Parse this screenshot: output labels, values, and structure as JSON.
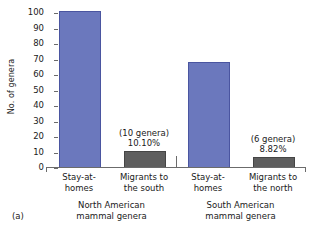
{
  "panel": {
    "label": "(a)"
  },
  "chart_data": {
    "type": "bar",
    "title": "",
    "xlabel": "",
    "ylabel": "No. of genera",
    "ylim": [
      0,
      100
    ],
    "yticks": [
      0,
      10,
      20,
      30,
      40,
      50,
      60,
      70,
      80,
      90,
      100
    ],
    "grid": false,
    "legend": "none",
    "categories": [
      "Stay-at-homes",
      "Migrants to the south",
      "Stay-at-homes",
      "Migrants to the north"
    ],
    "values": [
      100,
      10,
      67,
      6
    ],
    "bar_colors": [
      "#6b78bd",
      "#5e5e5e",
      "#6b78bd",
      "#5e5e5e"
    ],
    "annotations": [
      {
        "index": 1,
        "genera": "(10 genera)",
        "percent": "10.10%"
      },
      {
        "index": 3,
        "genera": "(6 genera)",
        "percent": "8.82%"
      }
    ],
    "groups": [
      {
        "label_line1": "North American",
        "label_line2": "mammal genera"
      },
      {
        "label_line1": "South American",
        "label_line2": "mammal genera"
      }
    ],
    "xtick_labels": [
      {
        "line1": "Stay-at-",
        "line2": "homes"
      },
      {
        "line1": "Migrants to",
        "line2": "the south"
      },
      {
        "line1": "Stay-at-",
        "line2": "homes"
      },
      {
        "line1": "Migrants to",
        "line2": "the north"
      }
    ]
  },
  "colors": {
    "stay_at_home_bar": "#6b78bd",
    "migrant_bar": "#5e5e5e",
    "axis": "#6b6b6b",
    "text": "#1a1a1a",
    "background": "#ffffff"
  }
}
